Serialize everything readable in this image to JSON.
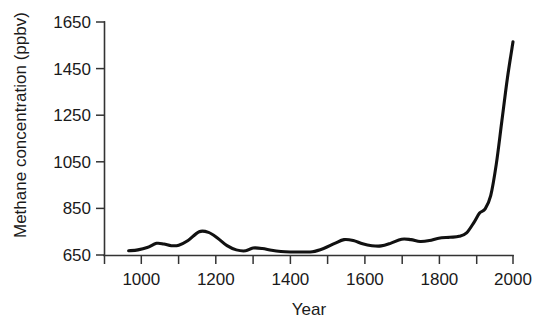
{
  "chart_data": {
    "type": "line",
    "title": "",
    "xlabel": "Year",
    "ylabel": "Methane concentration (ppbv)",
    "xlim": [
      900,
      2000
    ],
    "ylim": [
      650,
      1650
    ],
    "grid": false,
    "legend": null,
    "x_ticks_major": [
      1000,
      1200,
      1400,
      1600,
      1800,
      2000
    ],
    "x_tick_labels": [
      "1000",
      "1200",
      "1400",
      "1600",
      "1800",
      "2000"
    ],
    "x_ticks_minor": [
      900,
      1100,
      1300,
      1500,
      1700,
      1900
    ],
    "y_ticks": [
      650,
      850,
      1050,
      1250,
      1450,
      1650
    ],
    "y_tick_labels": [
      "650",
      "850",
      "1050",
      "1250",
      "1450",
      "1650"
    ],
    "series": [
      {
        "name": "Atmospheric methane concentration",
        "color": "#111111",
        "x": [
          965,
          990,
          1015,
          1040,
          1060,
          1080,
          1100,
          1125,
          1155,
          1180,
          1205,
          1230,
          1255,
          1280,
          1300,
          1325,
          1350,
          1375,
          1400,
          1430,
          1460,
          1490,
          1520,
          1545,
          1570,
          1595,
          1620,
          1645,
          1670,
          1700,
          1725,
          1750,
          1775,
          1800,
          1830,
          1855,
          1875,
          1895,
          1910,
          1925,
          1940,
          1955,
          1970,
          1985,
          2000
        ],
        "y": [
          668,
          672,
          682,
          700,
          697,
          690,
          692,
          712,
          750,
          747,
          722,
          690,
          672,
          668,
          680,
          678,
          670,
          665,
          663,
          663,
          664,
          678,
          700,
          716,
          712,
          698,
          690,
          689,
          700,
          718,
          716,
          708,
          712,
          722,
          726,
          730,
          745,
          790,
          830,
          848,
          905,
          1040,
          1225,
          1410,
          1565
        ]
      }
    ]
  },
  "figure": {
    "background_color": "#ffffff",
    "line_color": "#111111",
    "axis_color": "#333333"
  }
}
